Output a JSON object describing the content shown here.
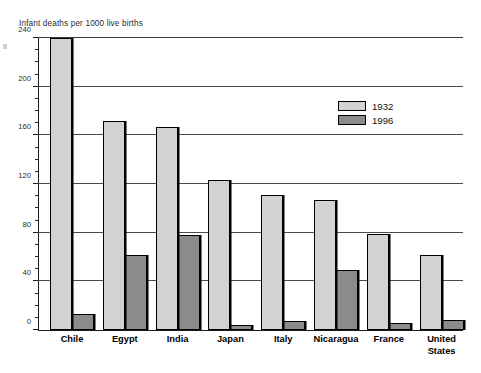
{
  "chart_data": {
    "type": "bar",
    "title": "Infant deaths per 1000 live births",
    "xlabel": "",
    "ylabel": "",
    "ylim": [
      0,
      240
    ],
    "ytick_step": 40,
    "yminor_step": 10,
    "grid": true,
    "legend_position": "inside-upper-right",
    "categories": [
      "Chile",
      "Egypt",
      "India",
      "Japan",
      "Italy",
      "Nicaragua",
      "France",
      "United States"
    ],
    "yticks": [
      0,
      40,
      80,
      120,
      160,
      200,
      240
    ],
    "series": [
      {
        "name": "1932",
        "color": "#d2d2d2",
        "values": [
          240,
          172,
          167,
          123,
          111,
          107,
          79,
          62
        ]
      },
      {
        "name": "1996",
        "color": "#8b8b8b",
        "values": [
          13,
          62,
          78,
          4,
          7,
          49,
          6,
          8
        ]
      }
    ]
  },
  "legend": {
    "items": [
      {
        "label": "1932",
        "color": "#d2d2d2"
      },
      {
        "label": "1996",
        "color": "#8b8b8b"
      }
    ]
  }
}
